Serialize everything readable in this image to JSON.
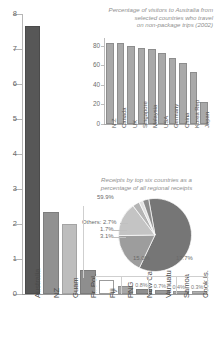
{
  "chart_data": [
    {
      "id": "main",
      "type": "bar",
      "title": "",
      "xlabel": "",
      "ylabel": "",
      "ylim": [
        0,
        8
      ],
      "yticks": [
        "0",
        "1",
        "2",
        "3",
        "4",
        "5",
        "6",
        "7",
        "8"
      ],
      "grid": false,
      "categories": [
        "Australia",
        "NZ",
        "Guam",
        "Fr. Pol.",
        "Fiji",
        "PNG",
        "New Cal.",
        "Vanuatu",
        "Samoa",
        "Cook Is."
      ],
      "values": [
        7.6,
        2.3,
        1.95,
        0.62,
        0.33,
        0.18,
        0.1,
        0.07,
        0.04,
        0.03
      ],
      "data_labels": [
        "",
        "",
        "",
        "",
        "",
        "",
        "0.8%",
        "0.7%",
        "0.4%",
        "0.3%"
      ],
      "bar_colors": [
        "#575757",
        "#919191",
        "#bdbdbd",
        "#8e8e8e",
        "#ffffff",
        "#a6a6a6",
        "#8e8e8e",
        "#9a9a9a",
        "#a8a8a8",
        "#b0b0b0"
      ]
    },
    {
      "id": "inset",
      "type": "bar",
      "title": "Percentage of visitors to Australia from selected countries who travel on non-package trips (2002)",
      "title_lines": [
        "Percentage of visitors to Australia from",
        "selected countries who travel",
        "on non-package trips (2002)"
      ],
      "xlabel": "",
      "ylabel": "",
      "ylim": [
        0,
        88
      ],
      "yticks": [
        "0",
        "20",
        "40",
        "60",
        "80"
      ],
      "grid": false,
      "categories": [
        "N.Z",
        "Canada",
        "UK",
        "Singapore",
        "Malaysia",
        "USA",
        "Germany",
        "China",
        "Korea Rep",
        "Japan"
      ],
      "values": [
        81,
        81,
        78,
        76,
        74.5,
        71,
        66,
        60.5,
        51,
        20
      ]
    },
    {
      "id": "pie",
      "type": "pie",
      "title": "Receipts by top six countries as a percentage of all regional receipts",
      "title_lines": [
        "Receipts by top six countries as a",
        "percentage of all regional receipts"
      ],
      "labels": [
        "59.9%",
        "17.7%",
        "15.0%",
        "3.1%",
        "1.7%",
        "Others: 2.7%"
      ],
      "values": [
        59.9,
        17.7,
        15.0,
        3.1,
        1.7,
        2.7
      ],
      "colors": [
        "#767676",
        "#9d9d9d",
        "#c4c4c4",
        "#b5b5b5",
        "#e0e0e0",
        "#8c8c8c"
      ],
      "legend": "none"
    }
  ],
  "main": {
    "yticks": [
      {
        "label": "8",
        "v": 8
      },
      {
        "label": "7",
        "v": 7
      },
      {
        "label": "6",
        "v": 6
      },
      {
        "label": "5",
        "v": 5
      },
      {
        "label": "4",
        "v": 4
      },
      {
        "label": "3",
        "v": 3
      },
      {
        "label": "2",
        "v": 2
      },
      {
        "label": "1",
        "v": 1
      },
      {
        "label": "0",
        "v": 0
      }
    ],
    "bars": [
      {
        "cat": "Australia",
        "v": 7.6,
        "dl": "",
        "c": "#575757",
        "outline": false
      },
      {
        "cat": "NZ",
        "v": 2.3,
        "dl": "",
        "c": "#919191",
        "outline": false
      },
      {
        "cat": "Guam",
        "v": 1.95,
        "dl": "",
        "c": "#bdbdbd",
        "outline": false
      },
      {
        "cat": "Fr. Pol.",
        "v": 0.62,
        "dl": "",
        "c": "#8e8e8e",
        "outline": false
      },
      {
        "cat": "Fiji",
        "v": 0.33,
        "dl": "",
        "c": "#ffffff",
        "outline": true
      },
      {
        "cat": "PNG",
        "v": 0.18,
        "dl": "",
        "c": "#a6a6a6",
        "outline": false
      },
      {
        "cat": "New Cal.",
        "v": 0.1,
        "dl": "0.8%",
        "c": "#8e8e8e",
        "outline": false
      },
      {
        "cat": "Vanuatu",
        "v": 0.07,
        "dl": "0.7%",
        "c": "#9a9a9a",
        "outline": false
      },
      {
        "cat": "Samoa",
        "v": 0.04,
        "dl": "0.4%",
        "c": "#a8a8a8",
        "outline": false
      },
      {
        "cat": "Cook Is.",
        "v": 0.03,
        "dl": "0.3%",
        "c": "#b0b0b0",
        "outline": false
      }
    ]
  },
  "inset": {
    "title_l1": "Percentage of visitors to Australia from",
    "title_l2": "selected countries who travel",
    "title_l3": "on non-package trips (2002)",
    "yticks": [
      {
        "label": "80",
        "v": 80
      },
      {
        "label": "60",
        "v": 60
      },
      {
        "label": "40",
        "v": 40
      },
      {
        "label": "20",
        "v": 20
      },
      {
        "label": "0",
        "v": 0
      }
    ],
    "bars": [
      {
        "cat": "N.Z",
        "v": 81
      },
      {
        "cat": "Canada",
        "v": 81
      },
      {
        "cat": "UK",
        "v": 78
      },
      {
        "cat": "Singapore",
        "v": 76
      },
      {
        "cat": "Malaysia",
        "v": 74.5
      },
      {
        "cat": "USA",
        "v": 71
      },
      {
        "cat": "Germany",
        "v": 66
      },
      {
        "cat": "China",
        "v": 60.5
      },
      {
        "cat": "Korea Rep",
        "v": 51
      },
      {
        "cat": "Japan",
        "v": 20
      }
    ]
  },
  "pie": {
    "title_l1": "Receipts by top six countries as a",
    "title_l2": "percentage of all regional receipts",
    "lab_main": "59.9%",
    "lab_right": "17.7%",
    "lab_left": "15.0%",
    "lab_a": "3.1%",
    "lab_b": "1.7%",
    "lab_others": "Others: 2.7%",
    "slices": [
      {
        "label": "59.9%",
        "v": 59.9,
        "c": "#767676"
      },
      {
        "label": "17.7%",
        "v": 17.7,
        "c": "#9d9d9d"
      },
      {
        "label": "15.0%",
        "v": 15.0,
        "c": "#c4c4c4"
      },
      {
        "label": "3.1%",
        "v": 3.1,
        "c": "#b5b5b5"
      },
      {
        "label": "1.7%",
        "v": 1.7,
        "c": "#e0e0e0"
      },
      {
        "label": "Others: 2.7%",
        "v": 2.7,
        "c": "#8c8c8c"
      }
    ]
  }
}
